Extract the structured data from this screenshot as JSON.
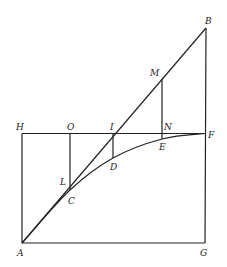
{
  "diagram": {
    "type": "geometric-figure",
    "colors": {
      "stroke": "#222222",
      "background": "#ffffff"
    },
    "points": {
      "A": {
        "label": "A",
        "x": 22,
        "y": 243,
        "lx": 17,
        "ly": 256
      },
      "G": {
        "label": "G",
        "x": 205,
        "y": 243,
        "lx": 200,
        "ly": 256
      },
      "H": {
        "label": "H",
        "x": 22,
        "y": 133.5,
        "lx": 16,
        "ly": 130
      },
      "F": {
        "label": "F",
        "x": 205,
        "y": 133.5,
        "lx": 208,
        "ly": 138
      },
      "B": {
        "label": "B",
        "x": 206,
        "y": 28,
        "lx": 205,
        "ly": 24
      },
      "O": {
        "label": "O",
        "x": 70,
        "y": 133.5,
        "lx": 67,
        "ly": 130
      },
      "I": {
        "label": "I",
        "x": 113,
        "y": 133.5,
        "lx": 110,
        "ly": 130
      },
      "N": {
        "label": "N",
        "x": 162,
        "y": 133.5,
        "lx": 164,
        "ly": 130
      },
      "M": {
        "label": "M",
        "x": 162,
        "y": 79,
        "lx": 150,
        "ly": 76
      },
      "E": {
        "label": "E",
        "x": 162,
        "y": 139,
        "lx": 159,
        "ly": 150
      },
      "D": {
        "label": "D",
        "x": 113,
        "y": 158,
        "lx": 110,
        "ly": 170
      },
      "L": {
        "label": "L",
        "x": 70,
        "y": 183,
        "lx": 60,
        "ly": 185
      },
      "C": {
        "label": "C",
        "x": 70,
        "y": 190,
        "lx": 68,
        "ly": 204
      }
    },
    "segments": [
      {
        "name": "AG",
        "from": "A",
        "to": "G"
      },
      {
        "name": "GB",
        "from": "G",
        "to": "B"
      },
      {
        "name": "AH",
        "from": "A",
        "to": "H"
      },
      {
        "name": "HF",
        "from": "H",
        "to": "F"
      },
      {
        "name": "AB",
        "from": "A",
        "to": "B"
      },
      {
        "name": "OC",
        "from": "O",
        "to": "C"
      },
      {
        "name": "ID",
        "from": "I",
        "to": "D"
      },
      {
        "name": "ME",
        "from": "M",
        "to": "E"
      }
    ],
    "curve": {
      "name": "arc-ACDEF",
      "from": "A",
      "through": [
        "C",
        "D",
        "E"
      ],
      "to": "F"
    }
  }
}
